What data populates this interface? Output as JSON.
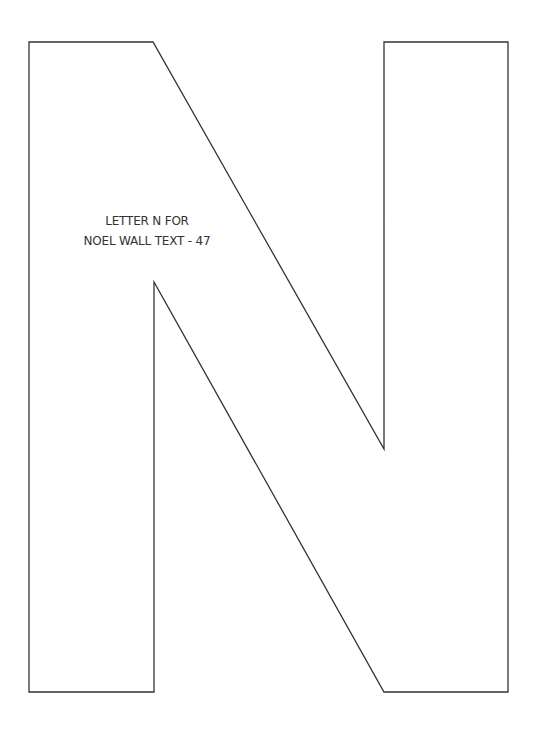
{
  "document": {
    "type": "printable letter template",
    "letter": "N",
    "label": {
      "line1": "LETTER N FOR",
      "line2": "NOEL WALL TEXT - 47"
    },
    "colors": {
      "background": "#ffffff",
      "outline": "#333333",
      "text": "#333333"
    }
  }
}
